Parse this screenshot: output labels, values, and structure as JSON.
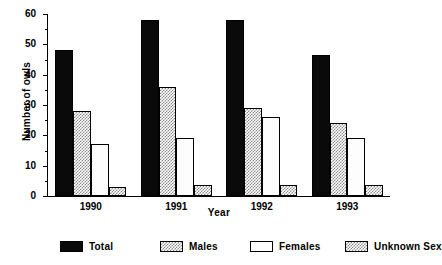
{
  "chart_data": {
    "type": "bar",
    "title": "",
    "xlabel": "Year",
    "ylabel": "Number of owls",
    "categories": [
      "1990",
      "1991",
      "1992",
      "1993"
    ],
    "series": [
      {
        "name": "Total",
        "values": [
          48,
          58,
          58,
          46.5
        ],
        "fill": "solid-black"
      },
      {
        "name": "Males",
        "values": [
          28,
          36,
          29,
          24
        ],
        "fill": "stipple-gray"
      },
      {
        "name": "Females",
        "values": [
          17,
          19,
          26,
          19
        ],
        "fill": "white"
      },
      {
        "name": "Unknown Sex",
        "values": [
          3,
          3.5,
          3.5,
          3.5
        ],
        "fill": "stipple-gray"
      }
    ],
    "ylim": [
      0,
      60
    ],
    "yticks": [
      0,
      10,
      20,
      30,
      40,
      50,
      60
    ],
    "ytick_labels": [
      "0",
      "10",
      "20",
      "30",
      "40",
      "50",
      "60"
    ],
    "grid": false,
    "legend_position": "bottom",
    "colors": {
      "total": "#0a0a0a",
      "males": "#8d8d8d",
      "females": "#fdfdfd",
      "unknown": "#8d8d8d",
      "axis": "#000000",
      "background": "#ffffff"
    }
  }
}
